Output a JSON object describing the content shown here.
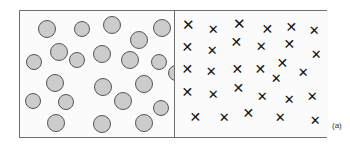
{
  "figure": {
    "label": "(a)",
    "caption_position": "bottom-right-outside",
    "background_color": "#ffffff",
    "panel_background_color": "#fbfbfb",
    "border_color": "#6e6e6e"
  },
  "chart_data": {
    "type": "scatter",
    "title": "",
    "subtitle": "",
    "xlabel": "",
    "ylabel": "",
    "grid": false,
    "legend_position": "none",
    "annotations": [
      "(a)"
    ],
    "panels": [
      {
        "name": "left-panel",
        "marker": "filled-circle",
        "marker_fill_color": "#cccccc",
        "marker_edge_color": "#555555",
        "count": 22,
        "xlim": [
          0,
          154
        ],
        "ylim": [
          0,
          128
        ],
        "points": [
          {
            "x": 27,
            "y": 18,
            "r": 9
          },
          {
            "x": 62,
            "y": 18,
            "r": 8
          },
          {
            "x": 92,
            "y": 14,
            "r": 9
          },
          {
            "x": 142,
            "y": 17,
            "r": 9
          },
          {
            "x": 119,
            "y": 29,
            "r": 9
          },
          {
            "x": 39,
            "y": 41,
            "r": 9
          },
          {
            "x": 57,
            "y": 49,
            "r": 8
          },
          {
            "x": 82,
            "y": 43,
            "r": 9
          },
          {
            "x": 14,
            "y": 51,
            "r": 8
          },
          {
            "x": 110,
            "y": 49,
            "r": 9
          },
          {
            "x": 139,
            "y": 51,
            "r": 8
          },
          {
            "x": 35,
            "y": 72,
            "r": 9
          },
          {
            "x": 83,
            "y": 76,
            "r": 9
          },
          {
            "x": 124,
            "y": 73,
            "r": 9
          },
          {
            "x": 13,
            "y": 90,
            "r": 8
          },
          {
            "x": 46,
            "y": 91,
            "r": 8
          },
          {
            "x": 103,
            "y": 90,
            "r": 9
          },
          {
            "x": 141,
            "y": 97,
            "r": 8
          },
          {
            "x": 36,
            "y": 112,
            "r": 9
          },
          {
            "x": 82,
            "y": 113,
            "r": 9
          },
          {
            "x": 124,
            "y": 112,
            "r": 9
          },
          {
            "x": 156,
            "y": 62,
            "r": 8
          }
        ]
      },
      {
        "name": "right-panel",
        "marker": "cross-x",
        "marker_color": "#111111",
        "count": 30,
        "xlim": [
          0,
          154
        ],
        "ylim": [
          0,
          128
        ],
        "points": [
          {
            "x": 13,
            "y": 15,
            "s": 15
          },
          {
            "x": 38,
            "y": 19,
            "s": 13
          },
          {
            "x": 64,
            "y": 14,
            "s": 15
          },
          {
            "x": 92,
            "y": 18,
            "s": 14
          },
          {
            "x": 116,
            "y": 16,
            "s": 14
          },
          {
            "x": 139,
            "y": 20,
            "s": 13
          },
          {
            "x": 12,
            "y": 36,
            "s": 14
          },
          {
            "x": 37,
            "y": 40,
            "s": 13
          },
          {
            "x": 61,
            "y": 31,
            "s": 14
          },
          {
            "x": 86,
            "y": 36,
            "s": 13
          },
          {
            "x": 114,
            "y": 33,
            "s": 14
          },
          {
            "x": 141,
            "y": 44,
            "s": 13
          },
          {
            "x": 12,
            "y": 58,
            "s": 14
          },
          {
            "x": 36,
            "y": 61,
            "s": 13
          },
          {
            "x": 62,
            "y": 58,
            "s": 14
          },
          {
            "x": 85,
            "y": 58,
            "s": 14
          },
          {
            "x": 107,
            "y": 52,
            "s": 14
          },
          {
            "x": 101,
            "y": 68,
            "s": 13
          },
          {
            "x": 128,
            "y": 62,
            "s": 13
          },
          {
            "x": 12,
            "y": 81,
            "s": 14
          },
          {
            "x": 38,
            "y": 84,
            "s": 13
          },
          {
            "x": 63,
            "y": 77,
            "s": 14
          },
          {
            "x": 87,
            "y": 86,
            "s": 13
          },
          {
            "x": 114,
            "y": 89,
            "s": 13
          },
          {
            "x": 137,
            "y": 86,
            "s": 13
          },
          {
            "x": 20,
            "y": 106,
            "s": 14
          },
          {
            "x": 49,
            "y": 107,
            "s": 13
          },
          {
            "x": 73,
            "y": 102,
            "s": 14
          },
          {
            "x": 105,
            "y": 107,
            "s": 13
          },
          {
            "x": 140,
            "y": 110,
            "s": 13
          }
        ]
      }
    ]
  }
}
